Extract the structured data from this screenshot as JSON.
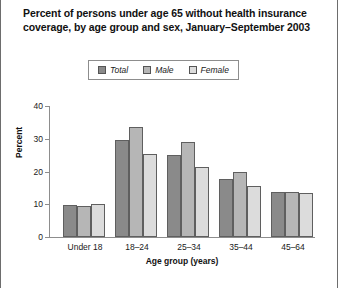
{
  "title": "Percent of persons under age 65 without health insurance coverage, by age group and sex, January–September 2003",
  "legend": {
    "items": [
      {
        "label": "Total",
        "color": "#8a8a8a",
        "swatch_name": "legend-swatch-total"
      },
      {
        "label": "Male",
        "color": "#b6b6b6",
        "swatch_name": "legend-swatch-male"
      },
      {
        "label": "Female",
        "color": "#dcdcdc",
        "swatch_name": "legend-swatch-female"
      }
    ]
  },
  "chart_data": {
    "type": "bar",
    "title": "Percent of persons under age 65 without health insurance coverage, by age group and sex, January–September 2003",
    "xlabel": "Age group (years)",
    "ylabel": "Percent",
    "categories": [
      "Under 18",
      "18–24",
      "25–34",
      "35–44",
      "45–64"
    ],
    "series": [
      {
        "name": "Total",
        "color": "#8a8a8a",
        "values": [
          9.7,
          29.7,
          25.0,
          17.6,
          13.6
        ]
      },
      {
        "name": "Male",
        "color": "#b6b6b6",
        "values": [
          9.4,
          33.6,
          29.0,
          19.7,
          13.6
        ]
      },
      {
        "name": "Female",
        "color": "#dcdcdc",
        "values": [
          10.0,
          25.5,
          21.5,
          15.5,
          13.5
        ]
      }
    ],
    "ylim": [
      0,
      40
    ],
    "yticks": [
      0,
      10,
      20,
      30,
      40
    ],
    "ytick_labels": [
      "0",
      "10",
      "20",
      "30",
      "40"
    ],
    "grid": false,
    "legend_position": "top-center",
    "bar_outline_color": "#5f5f5f",
    "axis_color": "#8d8d8d"
  }
}
